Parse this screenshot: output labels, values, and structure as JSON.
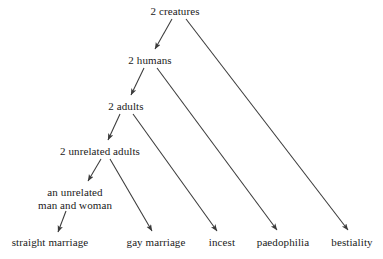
{
  "diagram": {
    "type": "tree-diagram",
    "background_color": "#ffffff",
    "text_color": "#1a1a1a",
    "edge_color": "#3a3a3a",
    "nodes": [
      {
        "id": "creatures",
        "label": "2 creatures",
        "x": 175,
        "y": 5,
        "level": 0
      },
      {
        "id": "humans",
        "label": "2 humans",
        "x": 150,
        "y": 54,
        "level": 1
      },
      {
        "id": "adults",
        "label": "2 adults",
        "x": 126,
        "y": 100,
        "level": 2
      },
      {
        "id": "unrelated",
        "label": "2 unrelated adults",
        "x": 100,
        "y": 145,
        "level": 3
      },
      {
        "id": "manwoman",
        "label": "an unrelated man and woman",
        "line1": "an unrelated",
        "line2": "man and woman",
        "x": 75,
        "y": 186,
        "level": 4
      },
      {
        "id": "straight",
        "label": "straight marriage",
        "x": 50,
        "y": 236,
        "level": 5
      },
      {
        "id": "gay",
        "label": "gay marriage",
        "x": 156,
        "y": 236,
        "level": 5
      },
      {
        "id": "incest",
        "label": "incest",
        "x": 222,
        "y": 236,
        "level": 5
      },
      {
        "id": "paedophilia",
        "label": "paedophilia",
        "x": 283,
        "y": 236,
        "level": 5
      },
      {
        "id": "bestiality",
        "label": "bestiality",
        "x": 352,
        "y": 236,
        "level": 5
      }
    ],
    "edges": [
      {
        "id": "creatures-humans",
        "from": "2 creatures",
        "to": "2 humans",
        "x1": 172,
        "y1": 19,
        "x2": 155,
        "y2": 49
      },
      {
        "id": "creatures-bestiality",
        "from": "2 creatures",
        "to": "bestiality",
        "x1": 186,
        "y1": 19,
        "x2": 348,
        "y2": 230
      },
      {
        "id": "humans-adults",
        "from": "2 humans",
        "to": "2 adults",
        "x1": 144,
        "y1": 68,
        "x2": 131,
        "y2": 95
      },
      {
        "id": "humans-paedophilia",
        "from": "2 humans",
        "to": "paedophilia",
        "x1": 157,
        "y1": 68,
        "x2": 277,
        "y2": 230
      },
      {
        "id": "adults-unrelated",
        "from": "2 adults",
        "to": "2 unrelated adults",
        "x1": 120,
        "y1": 114,
        "x2": 108,
        "y2": 140
      },
      {
        "id": "adults-incest",
        "from": "2 adults",
        "to": "incest",
        "x1": 133,
        "y1": 114,
        "x2": 217,
        "y2": 231
      },
      {
        "id": "unrelated-manwoman",
        "from": "2 unrelated adults",
        "to": "an unrelated man and woman",
        "x1": 101,
        "y1": 159,
        "x2": 88,
        "y2": 181
      },
      {
        "id": "unrelated-gay",
        "from": "2 unrelated adults",
        "to": "gay marriage",
        "x1": 110,
        "y1": 159,
        "x2": 152,
        "y2": 231
      },
      {
        "id": "manwoman-straight",
        "from": "an unrelated man and woman",
        "to": "straight marriage",
        "x1": 66,
        "y1": 211,
        "x2": 58,
        "y2": 232
      }
    ]
  }
}
